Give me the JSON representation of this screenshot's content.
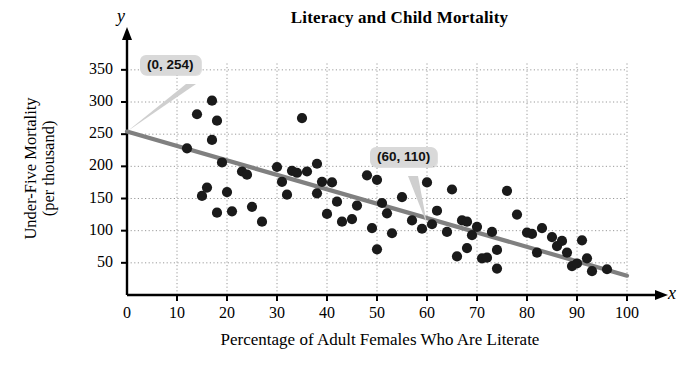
{
  "chart_data": {
    "type": "scatter",
    "title": "Literacy and Child Mortality",
    "xlabel": "Percentage of Adult Females Who Are Literate",
    "ylabel": "Under-Five Mortality\n(per thousand)",
    "ylabel_line1": "Under-Five Mortality",
    "ylabel_line2": "(per thousand)",
    "x_axis_letter": "x",
    "y_axis_letter": "y",
    "xlim": [
      0,
      103
    ],
    "ylim": [
      0,
      380
    ],
    "xticks": [
      0,
      10,
      20,
      30,
      40,
      50,
      60,
      70,
      80,
      90,
      100
    ],
    "yticks": [
      50,
      100,
      150,
      200,
      250,
      300,
      350
    ],
    "grid": true,
    "grid_style": "dotted",
    "legend": null,
    "point_color": "#1a1a1a",
    "line_color": "#808080",
    "grid_color": "#9a9a9a",
    "axis_color": "#000000",
    "trendline": {
      "label": "least-squares regression line",
      "points": [
        {
          "x": 0,
          "y": 254
        },
        {
          "x": 100,
          "y": 30
        }
      ],
      "slope": -2.24,
      "intercept": 254
    },
    "annotations": [
      {
        "id": "a",
        "text": "(0, 254)",
        "point": {
          "x": 0,
          "y": 254
        }
      },
      {
        "id": "b",
        "text": "(60, 110)",
        "point": {
          "x": 60,
          "y": 110
        }
      }
    ],
    "points": [
      {
        "x": 12,
        "y": 228
      },
      {
        "x": 14,
        "y": 281
      },
      {
        "x": 15,
        "y": 154
      },
      {
        "x": 16,
        "y": 167
      },
      {
        "x": 17,
        "y": 302
      },
      {
        "x": 17,
        "y": 241
      },
      {
        "x": 18,
        "y": 271
      },
      {
        "x": 18,
        "y": 128
      },
      {
        "x": 19,
        "y": 206
      },
      {
        "x": 20,
        "y": 160
      },
      {
        "x": 21,
        "y": 130
      },
      {
        "x": 23,
        "y": 192
      },
      {
        "x": 24,
        "y": 187
      },
      {
        "x": 25,
        "y": 137
      },
      {
        "x": 27,
        "y": 114
      },
      {
        "x": 30,
        "y": 199
      },
      {
        "x": 31,
        "y": 176
      },
      {
        "x": 32,
        "y": 156
      },
      {
        "x": 33,
        "y": 193
      },
      {
        "x": 34,
        "y": 190
      },
      {
        "x": 35,
        "y": 275
      },
      {
        "x": 36,
        "y": 192
      },
      {
        "x": 38,
        "y": 204
      },
      {
        "x": 38,
        "y": 158
      },
      {
        "x": 39,
        "y": 176
      },
      {
        "x": 40,
        "y": 126
      },
      {
        "x": 41,
        "y": 175
      },
      {
        "x": 42,
        "y": 145
      },
      {
        "x": 43,
        "y": 114
      },
      {
        "x": 45,
        "y": 118
      },
      {
        "x": 46,
        "y": 139
      },
      {
        "x": 48,
        "y": 186
      },
      {
        "x": 49,
        "y": 104
      },
      {
        "x": 50,
        "y": 179
      },
      {
        "x": 50,
        "y": 71
      },
      {
        "x": 51,
        "y": 143
      },
      {
        "x": 52,
        "y": 127
      },
      {
        "x": 53,
        "y": 96
      },
      {
        "x": 55,
        "y": 152
      },
      {
        "x": 57,
        "y": 116
      },
      {
        "x": 59,
        "y": 103
      },
      {
        "x": 60,
        "y": 175
      },
      {
        "x": 61,
        "y": 110
      },
      {
        "x": 62,
        "y": 131
      },
      {
        "x": 64,
        "y": 98
      },
      {
        "x": 65,
        "y": 164
      },
      {
        "x": 66,
        "y": 60
      },
      {
        "x": 67,
        "y": 116
      },
      {
        "x": 68,
        "y": 114
      },
      {
        "x": 68,
        "y": 73
      },
      {
        "x": 69,
        "y": 93
      },
      {
        "x": 70,
        "y": 106
      },
      {
        "x": 71,
        "y": 57
      },
      {
        "x": 72,
        "y": 58
      },
      {
        "x": 73,
        "y": 98
      },
      {
        "x": 74,
        "y": 70
      },
      {
        "x": 74,
        "y": 41
      },
      {
        "x": 76,
        "y": 162
      },
      {
        "x": 78,
        "y": 125
      },
      {
        "x": 80,
        "y": 97
      },
      {
        "x": 81,
        "y": 95
      },
      {
        "x": 82,
        "y": 66
      },
      {
        "x": 83,
        "y": 104
      },
      {
        "x": 85,
        "y": 90
      },
      {
        "x": 86,
        "y": 76
      },
      {
        "x": 87,
        "y": 84
      },
      {
        "x": 88,
        "y": 66
      },
      {
        "x": 89,
        "y": 45
      },
      {
        "x": 90,
        "y": 49
      },
      {
        "x": 91,
        "y": 85
      },
      {
        "x": 92,
        "y": 57
      },
      {
        "x": 93,
        "y": 37
      },
      {
        "x": 96,
        "y": 40
      }
    ]
  }
}
